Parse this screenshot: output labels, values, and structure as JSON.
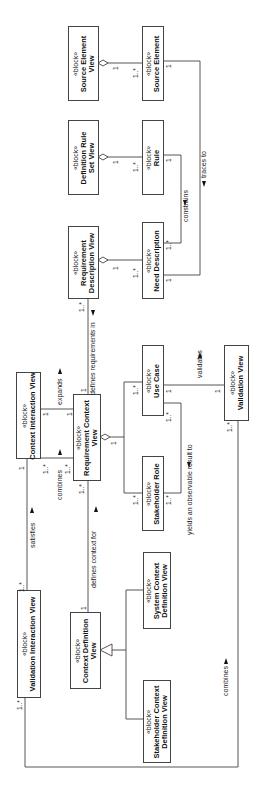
{
  "diagram": {
    "orientation": "rotated -90deg (landscape diagram on portrait page)",
    "stereotype": "«block»",
    "blocks": [
      {
        "id": "source-element-view",
        "stereotype": "«block»",
        "name_lines": [
          "Source Element",
          "View"
        ]
      },
      {
        "id": "source-element",
        "stereotype": "«block»",
        "name_lines": [
          "Source Element"
        ]
      },
      {
        "id": "definition-rule-set-view",
        "stereotype": "«block»",
        "name_lines": [
          "Definition Rule",
          "Set View"
        ]
      },
      {
        "id": "rule",
        "stereotype": "«block»",
        "name_lines": [
          "Rule"
        ]
      },
      {
        "id": "requirement-description-view",
        "stereotype": "«block»",
        "name_lines": [
          "Requirement",
          "Description View"
        ]
      },
      {
        "id": "need-description",
        "stereotype": "«block»",
        "name_lines": [
          "Need Description"
        ]
      },
      {
        "id": "context-interaction-view",
        "stereotype": "«block»",
        "name_lines": [
          "Context Interaction View"
        ]
      },
      {
        "id": "requirement-context-view",
        "stereotype": "«block»",
        "name_lines": [
          "Requirement Context",
          "View"
        ]
      },
      {
        "id": "use-case",
        "stereotype": "«block»",
        "name_lines": [
          "Use Case"
        ]
      },
      {
        "id": "stakeholder-role",
        "stereotype": "«block»",
        "name_lines": [
          "Stakeholder Role"
        ]
      },
      {
        "id": "validation-view",
        "stereotype": "«block»",
        "name_lines": [
          "Validation View"
        ]
      },
      {
        "id": "validation-interaction-view",
        "stereotype": "«block»",
        "name_lines": [
          "Validation Interaction View"
        ]
      },
      {
        "id": "context-definition-view",
        "stereotype": "«block»",
        "name_lines": [
          "Context Definition",
          "View"
        ]
      },
      {
        "id": "system-context-definition-view",
        "stereotype": "«block»",
        "name_lines": [
          "System Context",
          "Definition View"
        ]
      },
      {
        "id": "stakeholder-context-definition-view",
        "stereotype": "«block»",
        "name_lines": [
          "Stakeholder Context",
          "Definition View"
        ]
      }
    ],
    "relationships": [
      {
        "label": "traces to",
        "from": "source-element",
        "to": "need-description",
        "mult_from": "1",
        "mult_to": "1"
      },
      {
        "label": "constrains",
        "from": "rule",
        "to": "need-description",
        "mult_from": "1",
        "mult_to": "1..*"
      },
      {
        "label": "defines requirements in",
        "from": "requirement-description-view",
        "to": "requirement-context-view",
        "mult_from": "1..*",
        "mult_to": "1"
      },
      {
        "label": "expands",
        "from": "context-interaction-view",
        "to": "requirement-context-view",
        "mult_from": "1",
        "mult_to": "1"
      },
      {
        "label": "combines",
        "from": "context-interaction-view",
        "to": "requirement-context-view",
        "mult_from": "1..*",
        "mult_to": "1..*"
      },
      {
        "label": "validates",
        "from": "validation-view",
        "to": "use-case",
        "mult_from": "1",
        "mult_to": "1"
      },
      {
        "label": "yields an observable result to",
        "from": "use-case",
        "to": "stakeholder-role",
        "mult_from": "1..*",
        "mult_to": "1..*"
      },
      {
        "label": "satisfies",
        "from": "validation-interaction-view",
        "to": "context-interaction-view",
        "mult_from": "1..*",
        "mult_to": "1"
      },
      {
        "label": "defines context for",
        "from": "context-definition-view",
        "to": "requirement-context-view",
        "mult_from": "1",
        "mult_to": "1..*"
      },
      {
        "label": "combines",
        "from": "validation-interaction-view",
        "to": "validation-view",
        "mult_from": "1..*",
        "mult_to": "1..*"
      }
    ],
    "labels": {
      "traces_to": "traces to",
      "constrains": "constrains",
      "defines_requirements_in": "defines requirements in",
      "expands": "expands",
      "combines_top": "combines",
      "validates": "validates",
      "yields": "yields an observable result to",
      "satisfies": "satisfies",
      "defines_context_for": "defines context for",
      "combines_bottom": "combines"
    },
    "multiplicities": {
      "one": "1",
      "many": "1..*"
    }
  }
}
